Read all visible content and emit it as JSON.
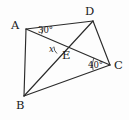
{
  "figure": {
    "type": "geometry-diagram",
    "background_color": "#fdfdfd",
    "line_color": "#2b2b2b",
    "text_color": "#1a1a1a"
  },
  "vertices": [
    {
      "id": "A",
      "label": "A",
      "x": 26,
      "y": 29,
      "label_x": 11,
      "label_y": 20
    },
    {
      "id": "D",
      "label": "D",
      "x": 93,
      "y": 21,
      "label_x": 85,
      "label_y": 6
    },
    {
      "id": "C",
      "label": "C",
      "x": 110,
      "y": 65,
      "label_x": 114,
      "label_y": 60
    },
    {
      "id": "B",
      "label": "B",
      "x": 24,
      "y": 96,
      "label_x": 16,
      "label_y": 100
    },
    {
      "id": "E",
      "label": "E",
      "x": 61,
      "y": 50,
      "label_x": 62,
      "label_y": 50
    }
  ],
  "segments": [
    {
      "id": "AB",
      "from": "A",
      "to": "B",
      "x1": 26,
      "y1": 29,
      "x2": 24,
      "y2": 96
    },
    {
      "id": "AD",
      "from": "A",
      "to": "D",
      "x1": 26,
      "y1": 29,
      "x2": 93,
      "y2": 21
    },
    {
      "id": "AC",
      "from": "A",
      "to": "C",
      "x1": 26,
      "y1": 29,
      "x2": 110,
      "y2": 65
    },
    {
      "id": "BD",
      "from": "B",
      "to": "D",
      "x1": 24,
      "y1": 96,
      "x2": 93,
      "y2": 21
    },
    {
      "id": "BC",
      "from": "B",
      "to": "C",
      "x1": 24,
      "y1": 96,
      "x2": 110,
      "y2": 65
    },
    {
      "id": "DC",
      "from": "D",
      "to": "C",
      "x1": 93,
      "y1": 21,
      "x2": 110,
      "y2": 65
    }
  ],
  "angles": [
    {
      "id": "angle-A",
      "label": "30°",
      "value": 30,
      "unit": "degrees",
      "at_vertex": "A",
      "between": [
        "AD",
        "AC"
      ],
      "label_x": 38,
      "label_y": 26,
      "arc_d": "M 43 27.9 A 17 17 0 0 1 41.6 34.2"
    },
    {
      "id": "angle-C",
      "label": "40°",
      "value": 40,
      "unit": "degrees",
      "at_vertex": "C",
      "between": [
        "CA",
        "CB"
      ],
      "label_x": 88,
      "label_y": 61,
      "arc_d": "M 93.8 57.8 A 18 18 0 0 0 93.1 70.2"
    },
    {
      "id": "angle-E",
      "label": "x",
      "value": null,
      "unit": "unknown",
      "at_vertex": "E",
      "between": [
        "EA",
        "ED"
      ],
      "label_x": 49,
      "label_y": 45,
      "arc_d": "M 53.9 46.6 A 9 9 0 0 0 57.0 53.5"
    }
  ]
}
